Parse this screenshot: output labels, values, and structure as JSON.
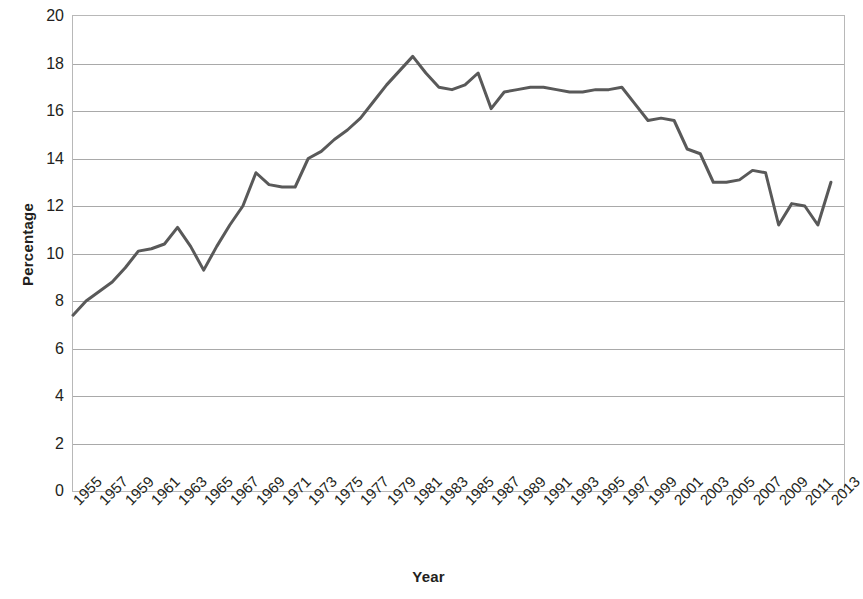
{
  "chart_data": {
    "type": "line",
    "title": "",
    "subtitle": "",
    "xlabel": "Year",
    "ylabel": "Percentage",
    "xlim": [
      1955,
      2014
    ],
    "ylim": [
      0,
      20
    ],
    "grid": true,
    "legend": false,
    "legend_position": "none",
    "line_color": "#595959",
    "line_width": 3,
    "y_ticks": [
      0,
      2,
      4,
      6,
      8,
      10,
      12,
      14,
      16,
      18,
      20
    ],
    "x_tick_labels": [
      "1955",
      "1957",
      "1959",
      "1961",
      "1963",
      "1965",
      "1967",
      "1969",
      "1971",
      "1973",
      "1975",
      "1977",
      "1979",
      "1981",
      "1983",
      "1985",
      "1987",
      "1989",
      "1991",
      "1993",
      "1995",
      "1997",
      "1999",
      "2001",
      "2003",
      "2005",
      "2007",
      "2009",
      "2011",
      "2013"
    ],
    "x": [
      1955,
      1956,
      1957,
      1958,
      1959,
      1960,
      1961,
      1962,
      1963,
      1964,
      1965,
      1966,
      1967,
      1968,
      1969,
      1970,
      1971,
      1972,
      1973,
      1974,
      1975,
      1976,
      1977,
      1978,
      1979,
      1980,
      1981,
      1982,
      1983,
      1984,
      1985,
      1986,
      1987,
      1988,
      1989,
      1990,
      1991,
      1992,
      1993,
      1994,
      1995,
      1996,
      1997,
      1998,
      1999,
      2000,
      2001,
      2002,
      2003,
      2004,
      2005,
      2006,
      2007,
      2008,
      2009,
      2010,
      2011,
      2012,
      2013
    ],
    "values": [
      7.4,
      8.0,
      8.4,
      8.8,
      9.4,
      10.1,
      10.2,
      10.4,
      11.1,
      10.3,
      9.3,
      10.3,
      11.2,
      12.0,
      13.4,
      12.9,
      12.8,
      12.8,
      14.0,
      14.3,
      14.8,
      15.2,
      15.7,
      16.4,
      17.1,
      17.7,
      18.3,
      17.6,
      17.0,
      16.9,
      17.1,
      17.6,
      16.1,
      16.8,
      16.9,
      17.0,
      17.0,
      16.9,
      16.8,
      16.8,
      16.9,
      16.9,
      17.0,
      16.3,
      15.6,
      15.7,
      15.6,
      14.4,
      14.2,
      13.0,
      13.0,
      13.1,
      13.5,
      13.4,
      11.2,
      12.1,
      12.0,
      11.2,
      13.0
    ]
  },
  "axes": {
    "y_title": "Percentage",
    "x_title": "Year"
  }
}
